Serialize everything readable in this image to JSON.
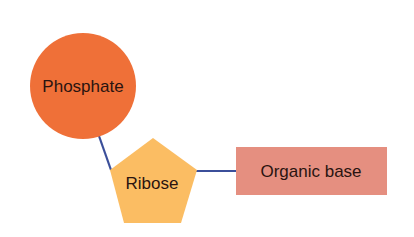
{
  "diagram": {
    "nodes": [
      {
        "id": "phosphate",
        "label": "Phosphate",
        "shape": "circle",
        "color": "#ef7038"
      },
      {
        "id": "ribose",
        "label": "Ribose",
        "shape": "pentagon",
        "color": "#fbbd63"
      },
      {
        "id": "organic_base",
        "label": "Organic base",
        "shape": "rectangle",
        "color": "#e58f80"
      }
    ],
    "edges": [
      {
        "from": "phosphate",
        "to": "ribose"
      },
      {
        "from": "ribose",
        "to": "organic_base"
      }
    ],
    "edge_color": "#3b4f9a"
  }
}
